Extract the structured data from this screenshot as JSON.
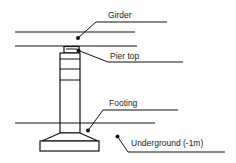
{
  "diagram": {
    "type": "bridge pier cross-section",
    "colors": {
      "stroke": "#111111",
      "text": "#222222",
      "background": "#ffffff"
    },
    "labels": {
      "girder": "Girder",
      "pier_top": "Pier top",
      "footing": "Footing",
      "underground": "Underground (-1m)"
    }
  }
}
